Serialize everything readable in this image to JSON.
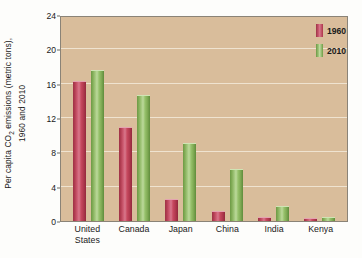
{
  "chart_data": {
    "type": "bar",
    "title": "",
    "xlabel": "",
    "ylabel_line1": "Per capita CO",
    "ylabel_sub": "2",
    "ylabel_line1b": " emissions (metric tons),",
    "ylabel_line2": "1960 and 2010",
    "ylabel_full": "Per capita CO2 emissions (metric tons), 1960 and 2010",
    "categories": [
      "United States",
      "Canada",
      "Japan",
      "China",
      "India",
      "Kenya"
    ],
    "category_lines": [
      [
        "United",
        "States"
      ],
      [
        "Canada"
      ],
      [
        "Japan"
      ],
      [
        "China"
      ],
      [
        "India"
      ],
      [
        "Kenya"
      ]
    ],
    "series": [
      {
        "name": "1960",
        "color": "#c04a5e",
        "values": [
          16.2,
          10.8,
          2.4,
          1.1,
          0.3,
          0.2
        ]
      },
      {
        "name": "2010",
        "color": "#8ec06a",
        "values": [
          17.5,
          14.6,
          9.0,
          6.0,
          1.6,
          0.3
        ]
      }
    ],
    "yticks": [
      0,
      4,
      8,
      12,
      16,
      20,
      24
    ],
    "ytick_labels": [
      "0",
      "4",
      "8",
      "12",
      "16",
      "20",
      "24"
    ],
    "ylim": [
      0,
      24
    ],
    "grid": true,
    "gridlines_at": [
      4,
      8,
      12,
      16,
      20
    ],
    "legend_position": "top-right",
    "plot_background": "#d9bd9b",
    "units": "metric tons"
  }
}
